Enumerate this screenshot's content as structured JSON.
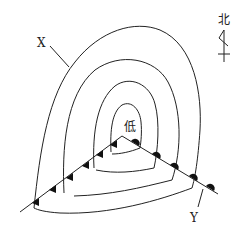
{
  "diagram": {
    "type": "weather-map-frontal-cyclone",
    "center_label": "低",
    "north_label": "北",
    "point_labels": [
      "X",
      "Y"
    ],
    "fronts": [
      {
        "name": "cold-front",
        "symbol": "triangles"
      },
      {
        "name": "warm-front",
        "symbol": "semicircles"
      }
    ],
    "isobar_count": 4,
    "colors": {
      "line": "#222222",
      "background": "#ffffff"
    }
  }
}
